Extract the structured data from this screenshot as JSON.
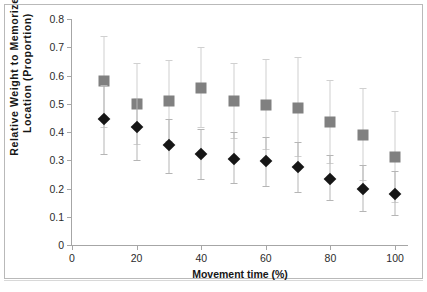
{
  "chart_data": {
    "type": "scatter",
    "title": "",
    "xlabel": "Movement time (%)",
    "ylabel": "Relative Weight to Memorized Location (Proportion)",
    "x": [
      10,
      20,
      30,
      40,
      50,
      60,
      70,
      80,
      90,
      100
    ],
    "xlim": [
      0,
      104
    ],
    "ylim": [
      0,
      0.8
    ],
    "xticks": [
      "0",
      "20",
      "40",
      "60",
      "80",
      "100"
    ],
    "xtick_values": [
      0,
      20,
      40,
      60,
      80,
      100
    ],
    "yticks": [
      "0",
      "0.1",
      "0.2",
      "0.3",
      "0.4",
      "0.5",
      "0.6",
      "0.7",
      "0.8"
    ],
    "ytick_values": [
      0,
      0.1,
      0.2,
      0.3,
      0.4,
      0.5,
      0.6,
      0.7,
      0.8
    ],
    "grid": false,
    "legend": "none",
    "series": [
      {
        "name": "gray-square-series",
        "marker": "square",
        "color": "#808080",
        "errorbar_color": "#d0d0d0",
        "values": [
          0.58,
          0.5,
          0.51,
          0.555,
          0.51,
          0.495,
          0.485,
          0.435,
          0.39,
          0.31
        ],
        "err_upper": [
          0.74,
          0.645,
          0.655,
          0.7,
          0.645,
          0.66,
          0.665,
          0.585,
          0.555,
          0.475
        ],
        "err_lower": [
          0.415,
          0.355,
          0.365,
          0.415,
          0.375,
          0.335,
          0.31,
          0.285,
          0.225,
          0.15
        ]
      },
      {
        "name": "black-diamond-series",
        "marker": "diamond",
        "color": "#161616",
        "errorbar_color": "#b5b5b5",
        "values": [
          0.447,
          0.418,
          0.353,
          0.323,
          0.305,
          0.297,
          0.275,
          0.235,
          0.197,
          0.18
        ],
        "err_upper": [
          0.565,
          0.52,
          0.445,
          0.41,
          0.4,
          0.383,
          0.365,
          0.318,
          0.283,
          0.262
        ],
        "err_lower": [
          0.318,
          0.298,
          0.25,
          0.23,
          0.215,
          0.207,
          0.185,
          0.155,
          0.118,
          0.102
        ]
      }
    ]
  }
}
